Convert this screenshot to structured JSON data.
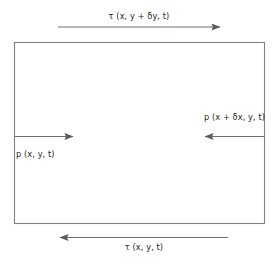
{
  "diagram": {
    "type": "free-body-force-diagram",
    "colors": {
      "stroke": "#808080",
      "arrow": "#6d6e71",
      "text": "#231f20",
      "background": "#ffffff"
    },
    "element": {
      "name": "fluid-element-rectangle",
      "x": 14,
      "y": 42,
      "width": 251,
      "height": 182
    },
    "labels": {
      "tau_top": "τ (x, y + δy, t)",
      "tau_bottom": "τ (x, y, t)",
      "p_left": "p (x, y, t)",
      "p_right": "p (x + δx, y, t)"
    },
    "arrows": [
      {
        "name": "shear-stress-top-arrow",
        "label_key": "tau_top",
        "direction": "right",
        "x1": 58,
        "y1": 27,
        "x2": 220,
        "y2": 27
      },
      {
        "name": "shear-stress-bottom-arrow",
        "label_key": "tau_bottom",
        "direction": "left",
        "x1": 228,
        "y1": 237,
        "x2": 60,
        "y2": 237
      },
      {
        "name": "pressure-left-arrow",
        "label_key": "p_left",
        "direction": "right",
        "x1": 14,
        "y1": 136,
        "x2": 73,
        "y2": 136
      },
      {
        "name": "pressure-right-arrow",
        "label_key": "p_right",
        "direction": "left",
        "x1": 265,
        "y1": 136,
        "x2": 205,
        "y2": 136
      }
    ]
  }
}
